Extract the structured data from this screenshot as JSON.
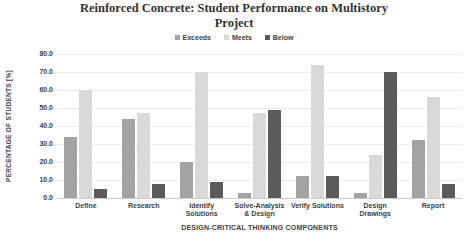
{
  "chart_data": {
    "type": "bar",
    "title": "Reinforced Concrete: Student Performance on Multistory Project",
    "categories": [
      "Define",
      "Research",
      "Identify Solutions",
      "Solve-Analysis & Design",
      "Verify Solutions",
      "Design Drawings",
      "Report"
    ],
    "series": [
      {
        "name": "Exceeds",
        "color": "#a3a3a3",
        "values": [
          34,
          44,
          20,
          3,
          12,
          3,
          32
        ]
      },
      {
        "name": "Meets",
        "color": "#d9d9d9",
        "values": [
          60,
          47,
          70,
          47,
          74,
          24,
          56
        ]
      },
      {
        "name": "Below",
        "color": "#5b5b5b",
        "values": [
          5,
          8,
          9,
          49,
          12,
          70,
          8
        ]
      }
    ],
    "xlabel": "DESIGN-CRITICAL THINKING COMPONENTS",
    "ylabel": "PERCENTAGE OF STUDENTS [%]",
    "ylim": [
      0,
      80
    ],
    "y_tick_step": 10,
    "y_tick_labels": [
      "0.0",
      "10.0",
      "20.0",
      "30.0",
      "40.0",
      "50.0",
      "60.0",
      "70.0",
      "80.0"
    ],
    "grid": true,
    "legend_position": "top"
  }
}
